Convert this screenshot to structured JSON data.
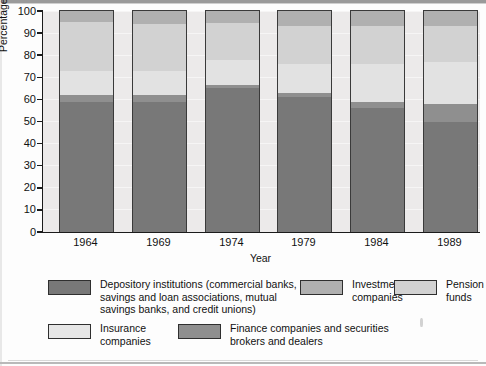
{
  "chart_data": {
    "type": "bar",
    "subtype": "stacked-100-percent",
    "title": "",
    "xlabel": "Year",
    "ylabel": "Percentage of Financial Assets",
    "categories": [
      "1964",
      "1969",
      "1974",
      "1979",
      "1984",
      "1989"
    ],
    "ylim": [
      0,
      100
    ],
    "yticks": [
      0,
      10,
      20,
      30,
      40,
      50,
      60,
      70,
      80,
      90,
      100
    ],
    "ytick_labels": [
      "0",
      "10",
      "20",
      "30",
      "40",
      "50",
      "60",
      "70",
      "80",
      "90",
      "100"
    ],
    "grid": true,
    "legend_position": "bottom",
    "stack_order_bottom_to_top": [
      "depository",
      "finance",
      "insurance",
      "pension",
      "investment"
    ],
    "series": [
      {
        "key": "depository",
        "name": "Depository institutions (commercial banks, savings and loan associations, mutual savings banks, and credit unions)",
        "color": "#787878",
        "values": [
          59,
          59,
          65,
          61,
          56,
          50
        ]
      },
      {
        "key": "finance",
        "name": "Finance companies and securities brokers and dealers",
        "color": "#8f8f8f",
        "values": [
          3,
          3,
          1.5,
          2,
          3,
          8
        ]
      },
      {
        "key": "insurance",
        "name": "Insurance companies",
        "color": "#e2e2e2",
        "values": [
          11,
          11,
          11.5,
          13,
          17,
          19
        ]
      },
      {
        "key": "pension",
        "name": "Pension funds",
        "color": "#d2d2d2",
        "values": [
          22,
          21,
          16.5,
          17,
          17,
          16
        ]
      },
      {
        "key": "investment",
        "name": "Investment companies",
        "color": "#b0b0b0",
        "values": [
          5,
          6,
          5.5,
          7,
          7,
          7
        ]
      }
    ],
    "cumulative_tops": {
      "1964": [
        59,
        62,
        73,
        95,
        100
      ],
      "1969": [
        59,
        62,
        73,
        94,
        100
      ],
      "1974": [
        65,
        66.5,
        78,
        94.5,
        100
      ],
      "1979": [
        61,
        63,
        76,
        93,
        100
      ],
      "1984": [
        56,
        59,
        76,
        93,
        100
      ],
      "1989": [
        50,
        58,
        77,
        93,
        100
      ]
    }
  },
  "axis": {
    "y_title": "Percentage of Financial Assets",
    "x_title": "Year",
    "y_ticks": [
      "100",
      "90",
      "80",
      "70",
      "60",
      "50",
      "40",
      "30",
      "20",
      "10",
      "0"
    ],
    "x_ticks": [
      "1964",
      "1969",
      "1974",
      "1979",
      "1984",
      "1989"
    ]
  },
  "legend": {
    "items": [
      {
        "key": "depository",
        "color": "#787878",
        "lines": [
          "Depository institutions (commercial banks,",
          "savings and loan associations, mutual",
          "savings banks, and credit unions)"
        ]
      },
      {
        "key": "investment",
        "color": "#b0b0b0",
        "lines": [
          "Investment",
          "companies"
        ]
      },
      {
        "key": "pension",
        "color": "#d2d2d2",
        "lines": [
          "Pension",
          "funds"
        ]
      },
      {
        "key": "insurance",
        "color": "#e6e6e6",
        "lines": [
          "Insurance",
          "companies"
        ]
      },
      {
        "key": "finance",
        "color": "#8f8f8f",
        "lines": [
          "Finance companies and securities",
          "brokers and dealers"
        ]
      }
    ]
  },
  "palette": {
    "plot_background": "#eceaea",
    "page_background": "#fdfdfd",
    "axis_line": "#1b1b1b",
    "segment_border": "#3a3a3a",
    "text": "#111111"
  }
}
